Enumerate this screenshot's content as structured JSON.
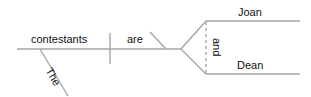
{
  "diagram": {
    "type": "sentence-diagram",
    "sentence": "The contestants are Joan and Dean",
    "line_color": "#a6a6a6",
    "text_color": "#111111",
    "words": {
      "subject": "contestants",
      "verb": "are",
      "modifier": "The",
      "conjunction": "and",
      "complement_1": "Joan",
      "complement_2": "Dean"
    }
  }
}
